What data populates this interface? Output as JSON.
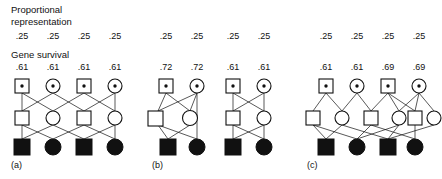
{
  "figure": {
    "caption_labels": {
      "proportional_representation": "Proportional\nrepresentation",
      "proportional_line1": "Proportional",
      "proportional_line2": "representation",
      "gene_survival": "Gene survival"
    },
    "symbol_legend": {
      "square": "male",
      "circle": "female",
      "filled": "living descendant",
      "open": "intermediate generation",
      "dotted": "founder"
    },
    "panels": [
      {
        "tag": "(a)",
        "tag_x": 11,
        "tag_y": 160,
        "founders": [
          {
            "sex": "male",
            "proportional_representation": ".25",
            "gene_survival": ".61",
            "x": 22
          },
          {
            "sex": "female",
            "proportional_representation": ".25",
            "gene_survival": ".61",
            "x": 53
          },
          {
            "sex": "male",
            "proportional_representation": ".25",
            "gene_survival": ".61",
            "x": 84
          },
          {
            "sex": "female",
            "proportional_representation": ".25",
            "gene_survival": ".61",
            "x": 115
          }
        ],
        "generation2": [
          {
            "sex": "male",
            "x": 22
          },
          {
            "sex": "female",
            "x": 53
          },
          {
            "sex": "male",
            "x": 84
          },
          {
            "sex": "female",
            "x": 115
          }
        ],
        "generation3": [
          {
            "sex": "male",
            "x": 22,
            "status": "filled"
          },
          {
            "sex": "female",
            "x": 53,
            "status": "filled"
          },
          {
            "sex": "male",
            "x": 84,
            "status": "filled"
          },
          {
            "sex": "female",
            "x": 115,
            "status": "filled"
          }
        ]
      },
      {
        "tag": "(b)",
        "tag_x": 152,
        "tag_y": 160,
        "founders": [
          {
            "sex": "male",
            "proportional_representation": ".25",
            "gene_survival": ".72",
            "x": 166
          },
          {
            "sex": "female",
            "proportional_representation": ".25",
            "gene_survival": ".72",
            "x": 197
          },
          {
            "sex": "male",
            "proportional_representation": ".25",
            "gene_survival": ".61",
            "x": 233
          },
          {
            "sex": "female",
            "proportional_representation": ".25",
            "gene_survival": ".61",
            "x": 264
          }
        ],
        "generation2": [
          {
            "sex": "male",
            "x": 158
          },
          {
            "sex": "female",
            "x": 190
          },
          {
            "sex": "male",
            "x": 233
          },
          {
            "sex": "female",
            "x": 264
          }
        ],
        "generation3": [
          {
            "sex": "male",
            "x": 168,
            "status": "filled"
          },
          {
            "sex": "female",
            "x": 197,
            "status": "filled"
          },
          {
            "sex": "male",
            "x": 233,
            "status": "filled"
          },
          {
            "sex": "female",
            "x": 264,
            "status": "filled"
          }
        ]
      },
      {
        "tag": "(c)",
        "tag_x": 307,
        "tag_y": 160,
        "founders": [
          {
            "sex": "male",
            "proportional_representation": ".25",
            "gene_survival": ".61",
            "x": 326
          },
          {
            "sex": "female",
            "proportional_representation": ".25",
            "gene_survival": ".61",
            "x": 357
          },
          {
            "sex": "male",
            "proportional_representation": ".25",
            "gene_survival": ".69",
            "x": 388
          },
          {
            "sex": "female",
            "proportional_representation": ".25",
            "gene_survival": ".69",
            "x": 419
          }
        ],
        "generation2": [
          {
            "sex": "male",
            "x": 313
          },
          {
            "sex": "female",
            "x": 342
          },
          {
            "sex": "male",
            "x": 371
          },
          {
            "sex": "female",
            "x": 399
          },
          {
            "sex": "male",
            "x": 415
          },
          {
            "sex": "female",
            "x": 434
          }
        ],
        "generation3": [
          {
            "sex": "male",
            "x": 326,
            "status": "filled"
          },
          {
            "sex": "female",
            "x": 357,
            "status": "filled"
          },
          {
            "sex": "male",
            "x": 388,
            "status": "filled"
          },
          {
            "sex": "female",
            "x": 415,
            "status": "filled"
          }
        ]
      }
    ],
    "rows": {
      "proportional_y": 33,
      "gene_survival_y": 64,
      "gen1_y": 86,
      "gen2_y": 118,
      "gen3_y": 145
    }
  }
}
